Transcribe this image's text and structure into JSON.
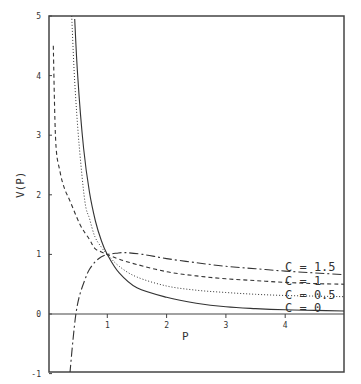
{
  "chart_data": {
    "type": "line",
    "title": "",
    "xlabel": "P",
    "ylabel": "V(P)",
    "xlim": [
      0,
      5
    ],
    "ylim": [
      -1,
      5
    ],
    "grid": false,
    "x_ticks": [
      "1",
      "2",
      "3",
      "4"
    ],
    "y_ticks": [
      "-1",
      "0",
      "1",
      "2",
      "3",
      "4",
      "5"
    ],
    "legend_position": "inline-right",
    "series": [
      {
        "name": "C = 0",
        "style": "solid",
        "x": [
          0.45,
          0.5,
          0.6,
          0.7,
          0.8,
          0.9,
          1.0,
          1.2,
          1.5,
          2.0,
          2.5,
          3.0,
          3.5,
          4.0,
          4.5,
          5.0
        ],
        "y": [
          4.95,
          4.0,
          2.78,
          2.04,
          1.56,
          1.23,
          1.0,
          0.69,
          0.44,
          0.28,
          0.18,
          0.12,
          0.09,
          0.07,
          0.06,
          0.05
        ]
      },
      {
        "name": "C = 0.5",
        "style": "dotted",
        "x": [
          0.4,
          0.45,
          0.52,
          0.62,
          0.7,
          0.79,
          0.9,
          1.0,
          1.2,
          1.5,
          2.0,
          2.5,
          3.0,
          3.5,
          4.0,
          4.5,
          5.0
        ],
        "y": [
          5.0,
          3.9,
          2.9,
          1.9,
          1.6,
          1.3,
          1.12,
          1.0,
          0.8,
          0.62,
          0.47,
          0.4,
          0.36,
          0.33,
          0.31,
          0.3,
          0.29
        ]
      },
      {
        "name": "C = 1",
        "style": "dashed",
        "x": [
          0.09,
          0.13,
          0.2,
          0.28,
          0.37,
          0.54,
          0.7,
          0.79,
          0.9,
          1.0,
          1.2,
          1.5,
          2.0,
          2.5,
          3.0,
          3.5,
          4.0,
          4.5,
          5.0
        ],
        "y": [
          4.5,
          2.9,
          2.4,
          2.1,
          1.9,
          1.5,
          1.25,
          1.1,
          1.04,
          1.0,
          0.92,
          0.83,
          0.71,
          0.64,
          0.59,
          0.56,
          0.53,
          0.51,
          0.5
        ]
      },
      {
        "name": "C = 1.5",
        "style": "dash-dot",
        "x": [
          0.37,
          0.42,
          0.47,
          0.53,
          0.62,
          0.7,
          0.8,
          0.9,
          1.0,
          1.15,
          1.3,
          1.6,
          2.0,
          2.5,
          3.0,
          3.5,
          4.0,
          4.5,
          5.0
        ],
        "y": [
          -1.0,
          -0.45,
          0.0,
          0.3,
          0.57,
          0.75,
          0.88,
          0.96,
          1.0,
          1.02,
          1.03,
          1.0,
          0.93,
          0.86,
          0.8,
          0.76,
          0.72,
          0.69,
          0.66
        ]
      }
    ],
    "labels": {
      "c15": "C = 1.5",
      "c1": "C = 1",
      "c05": "C = 0.5",
      "c0": "C = 0"
    }
  }
}
